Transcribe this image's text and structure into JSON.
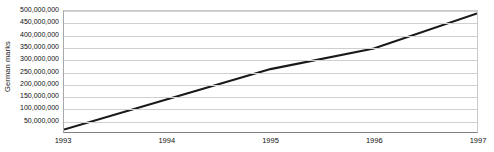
{
  "chart_data": {
    "type": "line",
    "title": "",
    "xlabel": "",
    "ylabel": "German marks",
    "x": [
      "1993",
      "1994",
      "1995",
      "1996",
      "1997"
    ],
    "categories": [
      "1993",
      "1994",
      "1995",
      "1996",
      "1997"
    ],
    "values": [
      10000000,
      135000000,
      260000000,
      345000000,
      490000000
    ],
    "series": [
      {
        "name": "German marks",
        "values": [
          10000000,
          135000000,
          260000000,
          345000000,
          490000000
        ]
      }
    ],
    "ylim": [
      0,
      500000000
    ],
    "ytick_values": [
      50000000,
      100000000,
      150000000,
      200000000,
      250000000,
      300000000,
      350000000,
      400000000,
      450000000,
      500000000
    ],
    "ytick_labels": [
      "500,000,000",
      "450,000,000",
      "400,000,000",
      "350,000,000",
      "300,000,000",
      "250,000,000",
      "200,000,000",
      "150,000,000",
      "100,000,000",
      "50,000,000"
    ],
    "xtick_labels": [
      "1993",
      "1994",
      "1995",
      "1996",
      "1997"
    ],
    "grid": true,
    "grid_axis": "y",
    "legend": false,
    "legend_position": "none",
    "line_color": "#1a1a1a",
    "grid_color": "#cfcfcf",
    "axis_color": "#808080",
    "background_color": "#ffffff",
    "line_width": 2.2
  }
}
